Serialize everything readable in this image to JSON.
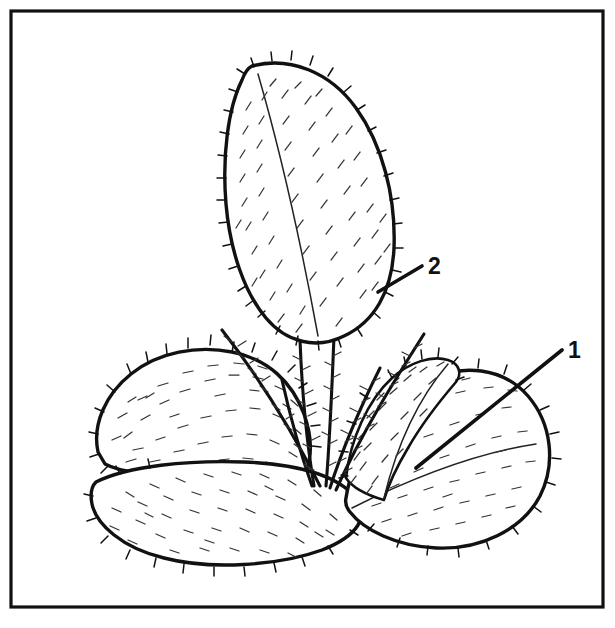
{
  "figure": {
    "kind": "botanical-line-drawing",
    "background_color": "#ffffff",
    "ink_color": "#111111",
    "frame": {
      "present": true,
      "x": 11,
      "y": 11,
      "width": 592,
      "height": 596,
      "stroke_width": 3.2
    },
    "canvas": {
      "width": 615,
      "height": 628
    }
  },
  "callouts": [
    {
      "id": "callout-2",
      "label": "2",
      "text_x": 428,
      "text_y": 274,
      "leader": {
        "x1": 378,
        "y1": 292,
        "x2": 422,
        "y2": 266
      },
      "target": "upright-lanceolate-leaf"
    },
    {
      "id": "callout-1",
      "label": "1",
      "text_x": 568,
      "text_y": 358,
      "leader": {
        "x1": 416,
        "y1": 468,
        "x2": 562,
        "y2": 350
      },
      "target": "right-rounded-leaf"
    }
  ],
  "parts": [
    {
      "id": "upright-leaf",
      "name": "upright lanceolate hairy leaf",
      "label": "2"
    },
    {
      "id": "left-upper-leaf",
      "name": "left upper rounded leaf",
      "label": ""
    },
    {
      "id": "bottom-leaf",
      "name": "lower broad rounded leaf",
      "label": ""
    },
    {
      "id": "right-leaf",
      "name": "right broad rounded leaf",
      "label": "1"
    },
    {
      "id": "young-folded-leaf",
      "name": "small folded young leaf",
      "label": ""
    },
    {
      "id": "petioles",
      "name": "hairy converging petioles",
      "label": ""
    }
  ]
}
